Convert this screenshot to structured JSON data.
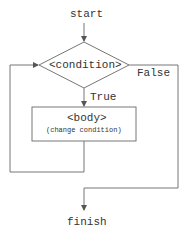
{
  "flowchart": {
    "start_label": "start",
    "condition_label": "<condition>",
    "true_label": "True",
    "false_label": "False",
    "body_label": "<body>",
    "body_sublabel": "(change condition)",
    "finish_label": "finish",
    "line_color": "#666666",
    "text_color": "#333333"
  }
}
